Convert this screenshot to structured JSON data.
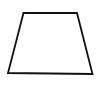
{
  "diagram": {
    "shape": "trapezoid",
    "stroke_color": "#111111",
    "fill_color": "#ffffff",
    "stroke_width": 1.8,
    "vertices": [
      {
        "name": "top-left",
        "x": 23.5,
        "y": 13
      },
      {
        "name": "top-right",
        "x": 77,
        "y": 13
      },
      {
        "name": "bottom-right",
        "x": 92.5,
        "y": 74
      },
      {
        "name": "bottom-left",
        "x": 8,
        "y": 73
      }
    ]
  }
}
